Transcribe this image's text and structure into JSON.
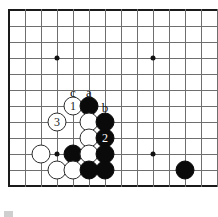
{
  "diagram": {
    "kind": "go-board-diagram",
    "board": {
      "origin_x": 9,
      "origin_y": 10,
      "step": 16,
      "cols": 13,
      "rows": 12,
      "line_color": "#6e6e6e",
      "edge_color": "#1a1a1a",
      "background": "#ffffff"
    },
    "star_points": [
      {
        "col": 3,
        "row": 3
      },
      {
        "col": 9,
        "row": 3
      },
      {
        "col": 3,
        "row": 9
      },
      {
        "col": 9,
        "row": 9
      }
    ],
    "stones": [
      {
        "col": 4,
        "row": 6,
        "color": "white",
        "label": "1"
      },
      {
        "col": 5,
        "row": 6,
        "color": "black",
        "label": ""
      },
      {
        "col": 3,
        "row": 7,
        "color": "white",
        "label": "3"
      },
      {
        "col": 5,
        "row": 7,
        "color": "white",
        "label": ""
      },
      {
        "col": 6,
        "row": 7,
        "color": "black",
        "label": ""
      },
      {
        "col": 5,
        "row": 8,
        "color": "white",
        "label": ""
      },
      {
        "col": 6,
        "row": 8,
        "color": "black",
        "label": "2"
      },
      {
        "col": 2,
        "row": 9,
        "color": "white",
        "label": ""
      },
      {
        "col": 4,
        "row": 9,
        "color": "black",
        "label": ""
      },
      {
        "col": 5,
        "row": 9,
        "color": "white",
        "label": ""
      },
      {
        "col": 6,
        "row": 9,
        "color": "black",
        "label": ""
      },
      {
        "col": 3,
        "row": 10,
        "color": "white",
        "label": ""
      },
      {
        "col": 4,
        "row": 10,
        "color": "white",
        "label": ""
      },
      {
        "col": 5,
        "row": 10,
        "color": "black",
        "label": ""
      },
      {
        "col": 6,
        "row": 10,
        "color": "black",
        "label": ""
      },
      {
        "col": 11,
        "row": 10,
        "color": "black",
        "label": ""
      }
    ],
    "point_labels": [
      {
        "text": "c",
        "col": 4,
        "row": 5,
        "dx": 0,
        "dy": 2
      },
      {
        "text": "a",
        "col": 5,
        "row": 5,
        "dx": 0,
        "dy": 2
      },
      {
        "text": "b",
        "col": 6,
        "row": 6,
        "dx": 0,
        "dy": 1
      }
    ],
    "move_numbers": [
      "1",
      "2",
      "3"
    ],
    "colors": {
      "black_stone": "#0a0a0a",
      "white_stone": "#ffffff",
      "white_stone_border": "#2b2b2b",
      "label_text": "#111111"
    }
  }
}
